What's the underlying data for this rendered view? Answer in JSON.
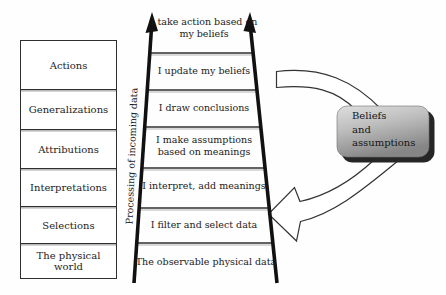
{
  "table": {
    "rows": [
      "Actions",
      "Generalizations",
      "Attributions",
      "Interpretations",
      "Selections",
      "The physical world"
    ]
  },
  "ladder": {
    "axis_label": "Processing of incoming data",
    "rungs": [
      "I take action based on my beliefs",
      "I update my beliefs",
      "I draw conclusions",
      "I make assumptions based on meanings",
      "I interpret, add meanings",
      "I filter and select data",
      "The observable physical data"
    ]
  },
  "beliefs_box": {
    "lines": [
      "Beliefs",
      "and",
      "assumptions"
    ]
  },
  "colors": {
    "line": "#2f2f2f",
    "line_echo": "#b3b3b3",
    "arrow_fill": "#ffffff",
    "box_gradient_top": "#dedede",
    "box_gradient_bottom": "#868686",
    "box_shadow": "#262626",
    "background": "#fefefe"
  }
}
